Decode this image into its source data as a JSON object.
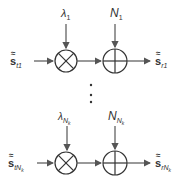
{
  "diagram": {
    "type": "signal-flow",
    "rows": [
      {
        "input": {
          "symbol": "s",
          "accent": "≈",
          "sub": "t1"
        },
        "gain": {
          "symbol": "λ",
          "sub": "1"
        },
        "noise": {
          "symbol": "N",
          "sub": "1"
        },
        "output": {
          "symbol": "s",
          "accent": "≈",
          "sub": "r1"
        },
        "multiplier_icon": "⊗",
        "adder_icon": "⊕"
      },
      {
        "input": {
          "symbol": "s",
          "accent": "≈",
          "sub": "tN",
          "subsub": "k"
        },
        "gain": {
          "symbol": "λ",
          "sub": "N",
          "subsub": "k"
        },
        "noise": {
          "symbol": "N",
          "sub": "N",
          "subsub": "k"
        },
        "output": {
          "symbol": "s",
          "accent": "≈",
          "sub": "rN",
          "subsub": "k"
        },
        "multiplier_icon": "⊗",
        "adder_icon": "⊕"
      }
    ],
    "ellipsis": "⋮",
    "colors": {
      "line": "#555555",
      "circle": "#333333",
      "text": "#333333"
    }
  }
}
